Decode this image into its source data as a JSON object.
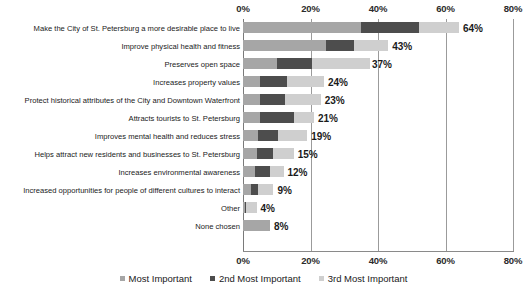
{
  "chart_data": {
    "type": "bar",
    "orientation": "horizontal",
    "stacked": true,
    "title": "",
    "subtitle": "",
    "xlabel": "",
    "ylabel": "",
    "xlim": [
      0,
      80
    ],
    "xtick_labels": [
      "0%",
      "20%",
      "40%",
      "60%",
      "80%"
    ],
    "xticks": [
      0,
      20,
      40,
      60,
      80
    ],
    "xaxis_position": "both",
    "grid": true,
    "legend_position": "bottom",
    "value_label_suffix": "%",
    "categories": [
      "Make the City of St. Petersburg a more desirable place to live",
      "Improve physical health and fitness",
      "Preserves open space",
      "Increases property values",
      "Protect historical attributes of the City and Downtown Waterfront",
      "Attracts tourists to St. Petersburg",
      "Improves mental health and reduces stress",
      "Helps attract new residents and businesses to St. Petersburg",
      "Increases environmental awareness",
      "Increased opportunities for people of different cultures to interact",
      "Other",
      "None chosen"
    ],
    "series": [
      {
        "name": "Most Important",
        "color": "#a6a6a6",
        "values": [
          35,
          24.5,
          10,
          5,
          5,
          5,
          4.5,
          4,
          3.5,
          2.5,
          0.5,
          8
        ]
      },
      {
        "name": "2nd Most Important",
        "color": "#4d4d4d",
        "values": [
          17,
          8.5,
          10.5,
          8,
          7.5,
          10,
          6,
          5,
          4.5,
          2,
          0.5,
          0
        ]
      },
      {
        "name": "3rd Most Important",
        "color": "#cfcfcf",
        "values": [
          12,
          10,
          17,
          11,
          10.5,
          6,
          8.5,
          6,
          4,
          4.5,
          3,
          0
        ]
      }
    ],
    "totals": [
      64,
      43,
      37,
      24,
      23,
      21,
      19,
      15,
      12,
      9,
      4,
      8
    ],
    "total_labels": [
      "64%",
      "43%",
      "37%",
      "24%",
      "23%",
      "21%",
      "19%",
      "15%",
      "12%",
      "9%",
      "4%",
      "8%"
    ],
    "legend": [
      {
        "label": "Most Important",
        "color": "#a6a6a6"
      },
      {
        "label": "2nd Most Important",
        "color": "#4d4d4d"
      },
      {
        "label": "3rd Most Important",
        "color": "#cfcfcf"
      }
    ]
  }
}
